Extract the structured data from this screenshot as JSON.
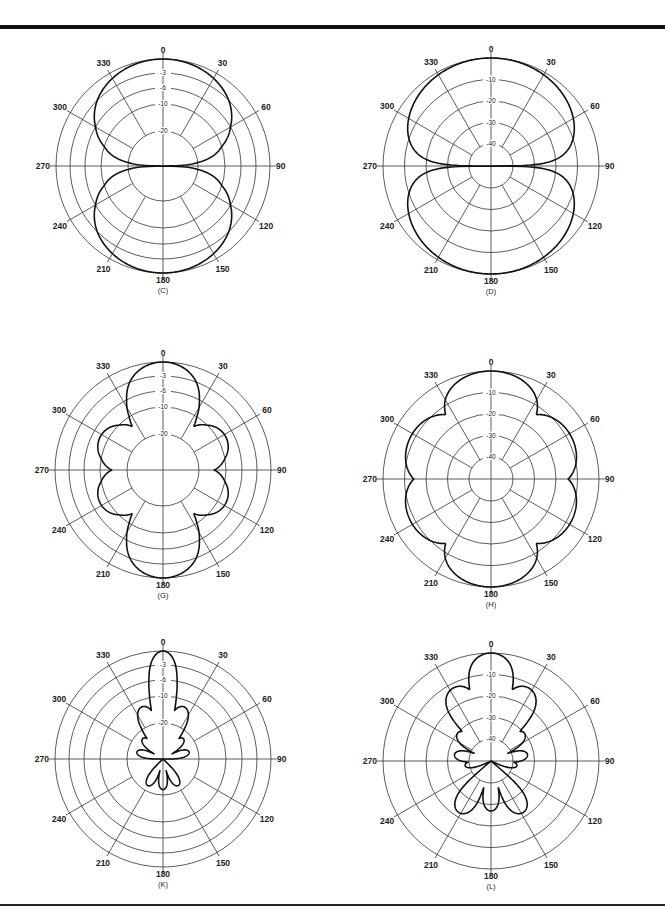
{
  "chart_data": [
    {
      "id": "C",
      "type": "polar",
      "caption": "(C)",
      "center": [
        163,
        166
      ],
      "scale": "dB-nonlinear",
      "ring_labels": [
        "-3",
        "-6",
        "-10",
        "-20"
      ],
      "ring_db": [
        0,
        -3,
        -6,
        -10,
        -20
      ],
      "ring_radii": [
        107,
        93,
        78,
        62,
        35
      ],
      "angle_labels": [
        "0",
        "30",
        "60",
        "90",
        "120",
        "150",
        "180",
        "210",
        "240",
        "270",
        "300",
        "330"
      ],
      "pattern": "figure-eight (dipole), lobes at 0 and 180",
      "series": [
        {
          "name": "pattern",
          "angles_deg": [
            0,
            15,
            30,
            45,
            60,
            75,
            90,
            105,
            120,
            135,
            150,
            165,
            180,
            195,
            210,
            225,
            240,
            255,
            270,
            285,
            300,
            315,
            330,
            345
          ],
          "db": [
            0,
            -0.3,
            -1.2,
            -3,
            -6,
            -11.7,
            -40,
            -11.7,
            -6,
            -3,
            -1.2,
            -0.3,
            0,
            -0.3,
            -1.2,
            -3,
            -6,
            -11.7,
            -40,
            -11.7,
            -6,
            -3,
            -1.2,
            -0.3
          ]
        }
      ]
    },
    {
      "id": "D",
      "type": "polar",
      "caption": "(D)",
      "center": [
        491,
        166
      ],
      "scale": "dB-linear",
      "ring_labels": [
        "-10",
        "-20",
        "-30",
        "-40"
      ],
      "ring_db": [
        0,
        -10,
        -20,
        -30,
        -40
      ],
      "ring_radii": [
        108,
        86.5,
        65,
        43.5,
        22
      ],
      "angle_labels": [
        "0",
        "30",
        "60",
        "90",
        "120",
        "150",
        "180",
        "210",
        "240",
        "270",
        "300",
        "330"
      ],
      "pattern": "figure-eight (dipole) on 40 dB scale",
      "series": [
        {
          "name": "pattern",
          "angles_deg": [
            0,
            15,
            30,
            45,
            60,
            75,
            90,
            105,
            120,
            135,
            150,
            165,
            180,
            195,
            210,
            225,
            240,
            255,
            270,
            285,
            300,
            315,
            330,
            345
          ],
          "db": [
            0,
            -0.3,
            -1.2,
            -3,
            -6,
            -11.7,
            -40,
            -11.7,
            -6,
            -3,
            -1.2,
            -0.3,
            0,
            -0.3,
            -1.2,
            -3,
            -6,
            -11.7,
            -40,
            -11.7,
            -6,
            -3,
            -1.2,
            -0.3
          ]
        }
      ]
    },
    {
      "id": "G",
      "type": "polar",
      "caption": "(G)",
      "center": [
        163,
        470
      ],
      "scale": "dB-nonlinear",
      "ring_labels": [
        "-3",
        "-6",
        "-10",
        "-20"
      ],
      "ring_db": [
        0,
        -3,
        -6,
        -10,
        -20
      ],
      "ring_radii": [
        108,
        94,
        79,
        63,
        36
      ],
      "angle_labels": [
        "0",
        "30",
        "60",
        "90",
        "120",
        "150",
        "180",
        "210",
        "240",
        "270",
        "300",
        "330"
      ],
      "pattern": "six-lobe pattern: main lobes at 0/180, side lobes near 60/120/240/300 at about -8 dB",
      "series": [
        {
          "name": "pattern",
          "lobes": [
            {
              "angle": 0,
              "peak_db": 0
            },
            {
              "angle": 62,
              "peak_db": -8
            },
            {
              "angle": 118,
              "peak_db": -8
            },
            {
              "angle": 180,
              "peak_db": 0
            },
            {
              "angle": 242,
              "peak_db": -8
            },
            {
              "angle": 298,
              "peak_db": -8
            }
          ]
        }
      ]
    },
    {
      "id": "H",
      "type": "polar",
      "caption": "(H)",
      "center": [
        491,
        479
      ],
      "scale": "dB-linear",
      "ring_labels": [
        "-10",
        "-20",
        "-30",
        "-40"
      ],
      "ring_db": [
        0,
        -10,
        -20,
        -30,
        -40
      ],
      "ring_radii": [
        108,
        86.5,
        65,
        43.5,
        22
      ],
      "angle_labels": [
        "0",
        "30",
        "60",
        "90",
        "120",
        "150",
        "180",
        "210",
        "240",
        "270",
        "300",
        "330"
      ],
      "pattern": "six-lobe pattern on 40 dB scale: main lobes at 0/180, side lobes near 60/120/240/300 at about -8 dB",
      "series": [
        {
          "name": "pattern",
          "lobes": [
            {
              "angle": 0,
              "peak_db": 0
            },
            {
              "angle": 62,
              "peak_db": -8
            },
            {
              "angle": 118,
              "peak_db": -8
            },
            {
              "angle": 180,
              "peak_db": 0
            },
            {
              "angle": 242,
              "peak_db": -8
            },
            {
              "angle": 298,
              "peak_db": -8
            }
          ]
        }
      ]
    },
    {
      "id": "K",
      "type": "polar",
      "caption": "(K)",
      "center": [
        163,
        759
      ],
      "scale": "dB-nonlinear",
      "ring_labels": [
        "-3",
        "-6",
        "-10",
        "-20"
      ],
      "ring_db": [
        0,
        -3,
        -6,
        -10,
        -20
      ],
      "ring_radii": [
        108,
        94,
        79,
        63,
        36
      ],
      "angle_labels": [
        "0",
        "30",
        "60",
        "90",
        "120",
        "150",
        "180",
        "210",
        "240",
        "270",
        "300",
        "330"
      ],
      "pattern": "narrow main beam at 0, first side lobes ~±22 deg at about -12 dB, minor lobes below -20 dB, back lobes near 180",
      "series": [
        {
          "name": "pattern",
          "lobes": [
            {
              "angle": 0,
              "peak_db": 0,
              "width": 9
            },
            {
              "angle": 22,
              "peak_db": -12.5
            },
            {
              "angle": -22,
              "peak_db": -12.5
            },
            {
              "angle": 45,
              "peak_db": -24
            },
            {
              "angle": -45,
              "peak_db": -24
            },
            {
              "angle": 75,
              "peak_db": -25
            },
            {
              "angle": -75,
              "peak_db": -25
            },
            {
              "angle": 150,
              "peak_db": -23
            },
            {
              "angle": -150,
              "peak_db": -23
            },
            {
              "angle": 180,
              "peak_db": -23
            }
          ]
        }
      ]
    },
    {
      "id": "L",
      "type": "polar",
      "caption": "(L)",
      "center": [
        491,
        761
      ],
      "scale": "dB-linear",
      "ring_labels": [
        "-10",
        "-20",
        "-30",
        "-40"
      ],
      "ring_db": [
        0,
        -10,
        -20,
        -30,
        -40
      ],
      "ring_radii": [
        108,
        86.5,
        65,
        43.5,
        22
      ],
      "angle_labels": [
        "0",
        "30",
        "60",
        "90",
        "120",
        "150",
        "180",
        "210",
        "240",
        "270",
        "300",
        "330"
      ],
      "pattern": "main beam at 0, side lobes ~±25 deg at about -12 dB, minor lobes near ±55 and ±80, back lobes around 150-210 at about -20 to -27 dB",
      "series": [
        {
          "name": "pattern",
          "lobes": [
            {
              "angle": 0,
              "peak_db": 0,
              "width": 11
            },
            {
              "angle": 27,
              "peak_db": -12
            },
            {
              "angle": -27,
              "peak_db": -12
            },
            {
              "angle": 50,
              "peak_db": -30
            },
            {
              "angle": -50,
              "peak_db": -30
            },
            {
              "angle": 80,
              "peak_db": -33
            },
            {
              "angle": -80,
              "peak_db": -33
            },
            {
              "angle": 100,
              "peak_db": -38
            },
            {
              "angle": -100,
              "peak_db": -38
            },
            {
              "angle": 148,
              "peak_db": -22
            },
            {
              "angle": -148,
              "peak_db": -22
            },
            {
              "angle": 180,
              "peak_db": -27
            }
          ]
        }
      ]
    }
  ]
}
